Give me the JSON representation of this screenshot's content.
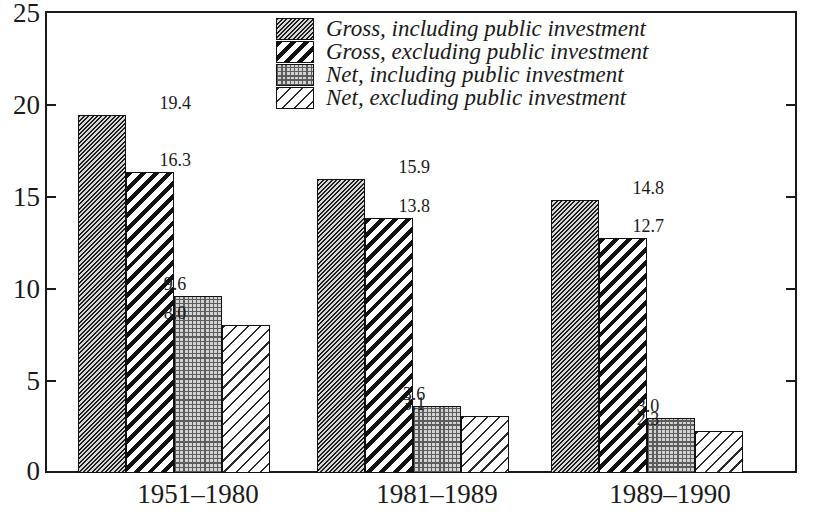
{
  "chart_data": {
    "type": "bar",
    "title": "",
    "subtitle": "",
    "xlabel": "",
    "ylabel": "",
    "ylim": [
      0,
      25
    ],
    "yticks": [
      0,
      5,
      10,
      15,
      20,
      25
    ],
    "grid": false,
    "legend_position": "top-center",
    "categories": [
      "1951–1980",
      "1981–1989",
      "1989–1990"
    ],
    "series": [
      {
        "name": "Gross, including public investment",
        "pattern": "dense-dark-diagonal-hatch",
        "values": [
          19.4,
          15.9,
          14.8
        ],
        "labels": [
          "19.4",
          "15.9",
          "14.8"
        ]
      },
      {
        "name": "Gross, excluding public investment",
        "pattern": "wide-black-diagonal-stripe",
        "values": [
          16.3,
          13.8,
          12.7
        ],
        "labels": [
          "16.3",
          "13.8",
          "12.7"
        ]
      },
      {
        "name": "Net, including public investment",
        "pattern": "light-dotted-stipple",
        "values": [
          9.6,
          3.6,
          3.0
        ],
        "labels": [
          "9.6",
          "3.6",
          "3.0"
        ]
      },
      {
        "name": "Net, excluding public investment",
        "pattern": "thin-sparse-diagonal-stripe",
        "values": [
          8.0,
          3.1,
          2.3
        ],
        "labels": [
          "8.0",
          "3.1",
          "2.3"
        ]
      }
    ]
  },
  "axis": {
    "y_tick_labels": [
      "25",
      "20",
      "15",
      "10",
      "5",
      "0"
    ],
    "x_tick_labels": [
      "1951–1980",
      "1981–1989",
      "1989–1990"
    ]
  },
  "legend": {
    "items": [
      {
        "label": "Gross, including public investment"
      },
      {
        "label": "Gross, excluding public investment"
      },
      {
        "label": "Net, including public investment"
      },
      {
        "label": "Net, excluding public investment"
      }
    ]
  },
  "colors": {
    "ink": "#1a1a1a",
    "frame": "#1a1a1a",
    "background": "#ffffff",
    "hatch_dark": "#1c1c1c",
    "dot_fill": "#d3d3d3"
  }
}
